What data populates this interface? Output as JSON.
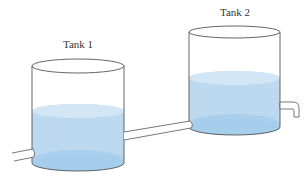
{
  "diagram": {
    "tanks": [
      {
        "id": "tank1",
        "label": "Tank 1",
        "label_pos": [
          78,
          48
        ],
        "left": 32,
        "right": 124,
        "top_y": 66,
        "top_ry": 7,
        "water_y": 111,
        "water_ry": 7,
        "bottom_y": 163,
        "bottom_ry": 8
      },
      {
        "id": "tank2",
        "label": "Tank 2",
        "label_pos": [
          235,
          16
        ],
        "left": 189,
        "right": 280,
        "top_y": 32,
        "top_ry": 6,
        "water_y": 78,
        "water_ry": 7,
        "bottom_y": 127,
        "bottom_ry": 8
      }
    ],
    "pipes": [
      {
        "id": "inlet-pipe",
        "from": "left-edge",
        "to": "tank1"
      },
      {
        "id": "connecting-pipe",
        "from": "tank1",
        "to": "tank2"
      },
      {
        "id": "outlet-pipe",
        "from": "tank2",
        "to": "downward-spout"
      }
    ],
    "colors": {
      "outline": "#555555",
      "water_body": "#bcd9f0",
      "water_surface": "#d3e6f6",
      "water_bottom": "#9cc7ea",
      "pipe_fill": "#ffffff"
    }
  }
}
